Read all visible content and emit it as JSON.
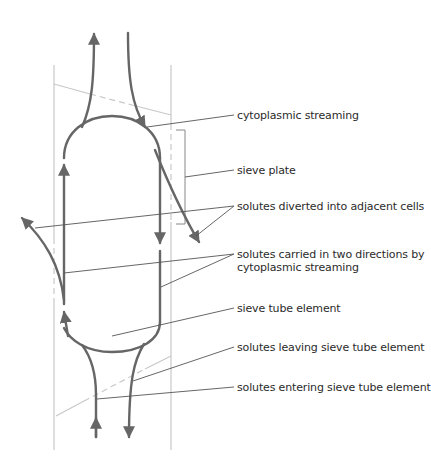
{
  "diagram": {
    "colors": {
      "arrow": "#666666",
      "wall": "#c8c8c8",
      "leader": "#555555",
      "text": "#2b2b2b",
      "background": "#ffffff"
    },
    "labels": [
      {
        "id": "cytoplasmic-streaming",
        "text": "cytoplasmic streaming",
        "y": 109
      },
      {
        "id": "sieve-plate",
        "text": "sieve plate",
        "y": 164
      },
      {
        "id": "solutes-diverted",
        "text": "solutes diverted into adjacent cells",
        "y": 200
      },
      {
        "id": "solutes-carried",
        "line1": "solutes carried in two directions by",
        "line2": "cytoplasmic streaming",
        "y": 248
      },
      {
        "id": "sieve-tube-element",
        "text": "sieve tube element",
        "y": 302
      },
      {
        "id": "solutes-leaving",
        "text": "solutes leaving sieve tube element",
        "y": 341
      },
      {
        "id": "solutes-entering",
        "text": "solutes entering sieve tube element",
        "y": 381
      }
    ]
  }
}
